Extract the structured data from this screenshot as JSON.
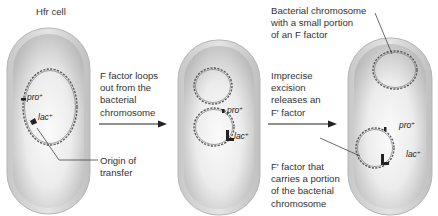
{
  "title": "Hfr cell",
  "panels": [
    {
      "id": "hfr",
      "genes": [
        {
          "name": "pro",
          "sup": "+"
        },
        {
          "name": "lac",
          "sup": "+"
        }
      ],
      "callout": "Origin of\ntransfer"
    },
    {
      "id": "looping",
      "genes": [
        {
          "name": "pro",
          "sup": "+"
        },
        {
          "name": "lac",
          "sup": "+"
        }
      ]
    },
    {
      "id": "f-prime",
      "genes": [
        {
          "name": "pro",
          "sup": "+"
        },
        {
          "name": "lac",
          "sup": "+"
        }
      ],
      "callout_top": "Bacterial chromosome\nwith a small portion\nof an F factor",
      "callout_bottom": "F′ factor that\ncarries a portion\nof the bacterial\nchromosome"
    }
  ],
  "steps": [
    {
      "label": "F factor loops\nout from the\nbacterial\nchromosome"
    },
    {
      "label": "Imprecise\nexcision\nreleases an\nF′ factor"
    }
  ],
  "colors": {
    "cell_outer": "#c9c9c9",
    "cell_inner": "#e6e6e6",
    "dna": "#555555",
    "arrow": "#222222"
  }
}
